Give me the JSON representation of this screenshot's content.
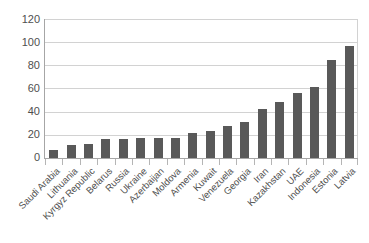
{
  "chart_data": {
    "type": "bar",
    "title": "",
    "subtitle": "",
    "xlabel": "",
    "ylabel": "",
    "ylim": [
      0,
      120
    ],
    "yticks": [
      0,
      20,
      40,
      60,
      80,
      100,
      120
    ],
    "grid": "horizontal",
    "legend": "none",
    "bar_color": "#595959",
    "gridline_color": "#d2d2d2",
    "axis_color": "#a6a6a6",
    "categories": [
      "Saudi Arabia",
      "Lithuania",
      "Kyrgyz Republic",
      "Belarus",
      "Russia",
      "Ukraine",
      "Azerbaijan",
      "Moldova",
      "Armenia",
      "Kuwait",
      "Venezuela",
      "Georgia",
      "Iran",
      "Kazakhstan",
      "UAE",
      "Indonesia",
      "Estonia",
      "Latvia"
    ],
    "values": [
      7,
      11,
      12,
      16,
      16,
      17,
      17,
      17,
      22,
      23,
      28,
      31,
      42,
      48,
      56,
      61,
      85,
      97
    ]
  }
}
